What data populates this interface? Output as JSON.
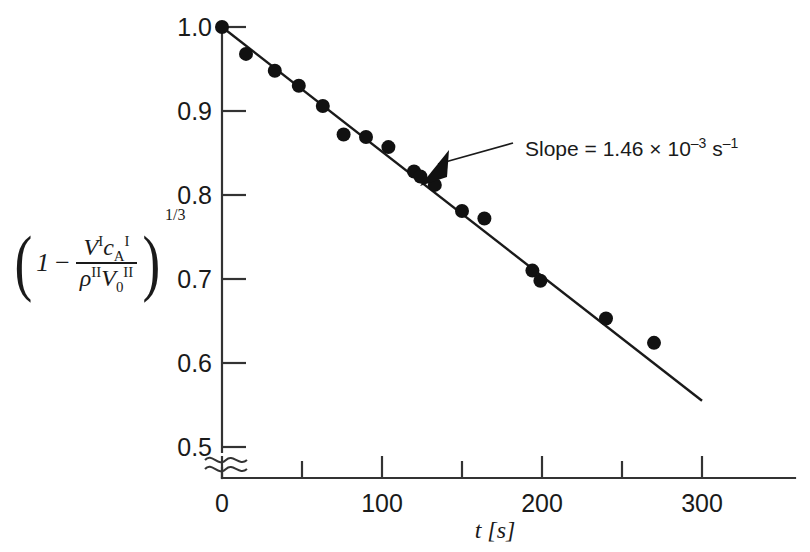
{
  "chart_data": {
    "type": "scatter",
    "title": "",
    "xlabel": "t [s]",
    "ylabel": "(1 - V^I c_A^I / (rho^II V_0^II))^(1/3)",
    "xlim": [
      0,
      310
    ],
    "ylim": [
      0.5,
      1.0
    ],
    "grid": false,
    "legend": "none",
    "x_major_ticks": [
      0,
      100,
      200,
      300
    ],
    "x_major_tick_labels": [
      "0",
      "100",
      "200",
      "300"
    ],
    "x_minor_ticks": [
      50,
      150,
      250
    ],
    "y_ticks": [
      0.5,
      0.6,
      0.7,
      0.8,
      0.9,
      1.0
    ],
    "y_tick_labels": [
      "0.5",
      "0.6",
      "0.7",
      "0.8",
      "0.9",
      "1.0"
    ],
    "y_axis_break": true,
    "y_axis_break_note": "broken axis below 0.5",
    "x": [
      0,
      15,
      33,
      48,
      63,
      76,
      90,
      104,
      120,
      124,
      133,
      150,
      164,
      194,
      199,
      240,
      270
    ],
    "y": [
      1.0,
      0.968,
      0.948,
      0.93,
      0.906,
      0.872,
      0.869,
      0.857,
      0.828,
      0.822,
      0.812,
      0.781,
      0.772,
      0.71,
      0.698,
      0.653,
      0.624
    ],
    "fit_line": {
      "x": [
        0,
        300
      ],
      "y": [
        1.0,
        0.555
      ],
      "slope": -0.00146,
      "intercept": 1.0
    },
    "annotations": [
      {
        "name": "slope-annotation",
        "text_plain": "Slope = 1.46 × 10⁻³ s⁻¹",
        "prefix": "Slope = 1.46 × 10",
        "exp1": "–3",
        "mid": " s",
        "exp2": "–1",
        "target_x": 133,
        "target_y": 0.806
      }
    ]
  },
  "axis": {
    "y_labels": [
      "1.0",
      "0.9",
      "0.8",
      "0.7",
      "0.6",
      "0.5"
    ],
    "x_labels": [
      "0",
      "100",
      "200",
      "300"
    ],
    "x_title": "t [s]"
  },
  "ylabel_formula": {
    "open_paren": "(",
    "one": "1",
    "minus": "−",
    "numerator_V": "V",
    "numerator_V_sup": "I",
    "numerator_c": "c",
    "numerator_c_sub": "A",
    "numerator_c_sup": "I",
    "denominator_rho": "ρ",
    "denominator_rho_sup": "II",
    "denominator_V": "V",
    "denominator_V_sub": "0",
    "denominator_V_sup": "II",
    "close_paren": ")",
    "exponent": "1/3"
  },
  "annotation": {
    "slope_prefix": "Slope = 1.46 × 10",
    "slope_exp1": "–3",
    "slope_mid": " s",
    "slope_exp2": "–1"
  },
  "colors": {
    "ink": "#1a1a1a",
    "axis": "#333333",
    "point": "#111111",
    "background": "#ffffff"
  }
}
